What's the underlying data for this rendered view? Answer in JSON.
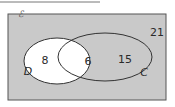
{
  "diagram": {
    "type": "venn",
    "universal_set_symbol": "ℰ",
    "sets": [
      {
        "name": "D",
        "label": "D",
        "only_count": "8"
      },
      {
        "name": "C",
        "label": "C",
        "only_count": "15"
      }
    ],
    "intersection_count": "6",
    "outside_count": "21",
    "colors": {
      "background_box": "#c9c9c9",
      "set_D_fill": "#ffffff",
      "outline": "#333333"
    }
  }
}
